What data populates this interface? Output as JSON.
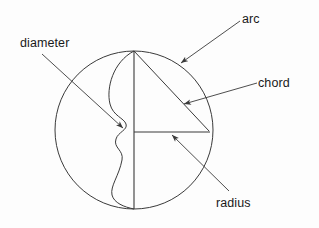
{
  "figure": {
    "background_color": "#fdfdfd",
    "stroke_color": "#3a3a3a",
    "text_color": "#1a1a1a",
    "circle": {
      "cx": 134,
      "cy": 130,
      "r": 79
    }
  },
  "labels": {
    "arc": "arc",
    "chord": "chord",
    "diameter": "diameter",
    "radius": "radius"
  },
  "parts": [
    {
      "name": "arc",
      "label": "arc",
      "description": "wavy curve drawn inside the circle from top point to bottom point"
    },
    {
      "name": "chord",
      "label": "chord",
      "description": "straight segment from top of circle to right of circle"
    },
    {
      "name": "diameter",
      "label": "diameter",
      "description": "vertical segment through the centre from top to bottom of the circle"
    },
    {
      "name": "radius",
      "label": "radius",
      "description": "horizontal segment from centre to the right edge of the circle"
    }
  ]
}
